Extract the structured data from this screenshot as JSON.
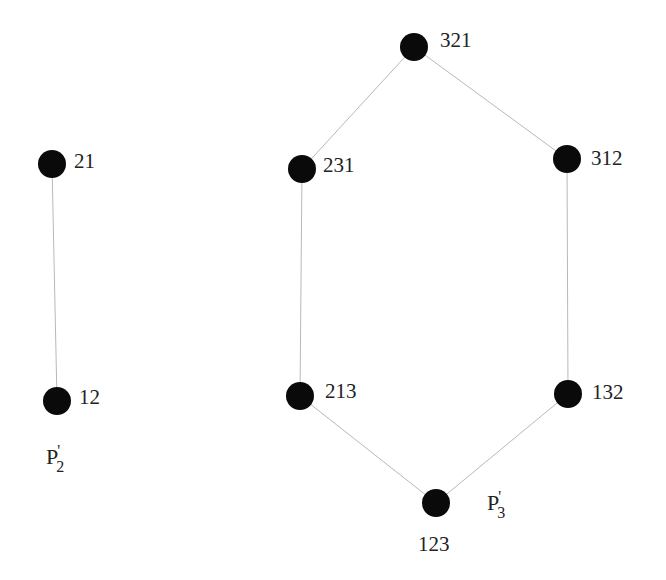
{
  "diagram": {
    "type": "hasse-diagram",
    "node_color": "#0a0a0a",
    "edge_color": "#b8b8b8",
    "posets": [
      {
        "name": "P2'",
        "label": {
          "base": "P",
          "sub": "2",
          "prime": "'"
        },
        "nodes": [
          {
            "id": "21",
            "label": "21",
            "x": 52,
            "y": 164
          },
          {
            "id": "12",
            "label": "12",
            "x": 57,
            "y": 401
          }
        ],
        "edges": [
          [
            "21",
            "12"
          ]
        ]
      },
      {
        "name": "P3'",
        "label": {
          "base": "P",
          "sub": "3",
          "prime": "'"
        },
        "nodes": [
          {
            "id": "321",
            "label": "321",
            "x": 414,
            "y": 47
          },
          {
            "id": "231",
            "label": "231",
            "x": 302,
            "y": 169
          },
          {
            "id": "312",
            "label": "312",
            "x": 567,
            "y": 159
          },
          {
            "id": "213",
            "label": "213",
            "x": 300,
            "y": 396
          },
          {
            "id": "132",
            "label": "132",
            "x": 568,
            "y": 394
          },
          {
            "id": "123",
            "label": "123",
            "x": 436,
            "y": 503
          }
        ],
        "edges": [
          [
            "321",
            "231"
          ],
          [
            "321",
            "312"
          ],
          [
            "231",
            "213"
          ],
          [
            "312",
            "132"
          ],
          [
            "213",
            "123"
          ],
          [
            "132",
            "123"
          ]
        ]
      }
    ]
  }
}
